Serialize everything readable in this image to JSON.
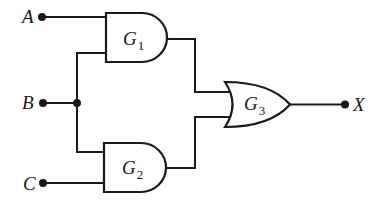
{
  "diagram": {
    "type": "logic-circuit",
    "inputs": [
      {
        "id": "A",
        "label": "A"
      },
      {
        "id": "B",
        "label": "B"
      },
      {
        "id": "C",
        "label": "C"
      }
    ],
    "outputs": [
      {
        "id": "X",
        "label": "X"
      }
    ],
    "gates": [
      {
        "id": "G1",
        "type": "AND",
        "label": "G",
        "subscript": "1",
        "inputs": [
          "A",
          "B"
        ]
      },
      {
        "id": "G2",
        "type": "AND",
        "label": "G",
        "subscript": "2",
        "inputs": [
          "B",
          "C"
        ]
      },
      {
        "id": "G3",
        "type": "OR",
        "label": "G",
        "subscript": "3",
        "inputs": [
          "G1",
          "G2"
        ],
        "output": "X"
      }
    ],
    "colors": {
      "line": "#1a1a1a",
      "background": "#ffffff"
    }
  }
}
